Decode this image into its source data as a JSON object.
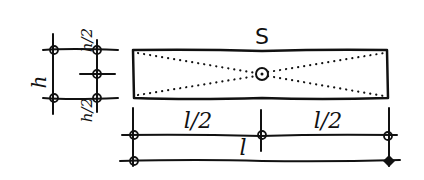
{
  "diagram": {
    "type": "engineering-sketch",
    "section": {
      "label": "S",
      "center_marker": "circle",
      "diagonals": "dotted"
    },
    "height_dimension": {
      "total_label": "h",
      "half_top_label": "h/2",
      "half_bottom_label": "h/2"
    },
    "length_dimension": {
      "half_left_label": "l/2",
      "half_right_label": "l/2",
      "total_label": "l"
    },
    "colors": {
      "ink": "#111111",
      "background": "#ffffff"
    }
  }
}
